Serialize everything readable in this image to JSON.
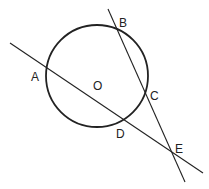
{
  "diagram": {
    "circle": {
      "cx": 97,
      "cy": 76,
      "r": 51,
      "stroke": "#222222",
      "center_label": "O"
    },
    "lines": [
      {
        "name": "secant-ADE",
        "x1": 10,
        "y1": 43,
        "x2": 203,
        "y2": 173
      },
      {
        "name": "secant-BCE",
        "x1": 108,
        "y1": 9,
        "x2": 185,
        "y2": 182
      }
    ],
    "points": [
      {
        "label": "A",
        "x": 36,
        "y": 81
      },
      {
        "label": "B",
        "x": 120,
        "y": 26
      },
      {
        "label": "C",
        "x": 150,
        "y": 100
      },
      {
        "label": "D",
        "x": 116,
        "y": 137
      },
      {
        "label": "E",
        "x": 176,
        "y": 153
      },
      {
        "label": "O",
        "x": 93,
        "y": 90
      }
    ]
  }
}
